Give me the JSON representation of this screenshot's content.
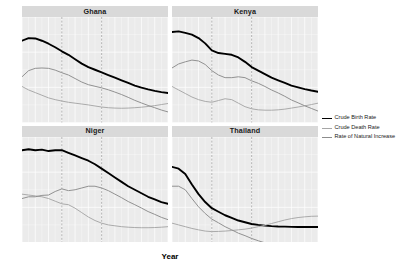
{
  "chart_data": {
    "type": "line",
    "title": "",
    "xlabel": "Year",
    "ylabel": "",
    "xlim": [
      1960,
      2070
    ],
    "ylim": [
      0,
      60
    ],
    "grid": true,
    "legend_position": "right",
    "facet_layout": "2x2",
    "xticks": [
      1960,
      1970,
      1980,
      1990,
      2000,
      2010,
      2020,
      2030,
      2040,
      2050,
      2060,
      2070
    ],
    "xtick_labels": [
      "1960",
      "1970",
      "1980",
      "1990",
      "2000",
      "2010",
      "2020",
      "2030",
      "2040",
      "2050",
      "2060",
      "2070"
    ],
    "yticks": [
      0,
      20,
      40,
      60
    ],
    "ytick_labels": [
      "0",
      "20",
      "40",
      "60"
    ],
    "reference_lines": [
      1990,
      2020
    ],
    "series_names": [
      "Crude Birth Rate",
      "Crude Death Rate",
      "Rate of Natural Increase"
    ],
    "series_colors": [
      "#000000",
      "#a6a6a6",
      "#8c8c8c"
    ],
    "x": [
      1960,
      1965,
      1970,
      1975,
      1980,
      1985,
      1990,
      1995,
      2000,
      2005,
      2010,
      2015,
      2020,
      2025,
      2030,
      2035,
      2040,
      2045,
      2050,
      2055,
      2060,
      2065,
      2070
    ],
    "panels": [
      {
        "name": "Ghana",
        "series": [
          {
            "name": "Crude Birth Rate",
            "values": [
              46.5,
              48.0,
              47.8,
              46.5,
              44.8,
              42.8,
              40.5,
              38.5,
              36.0,
              33.5,
              31.5,
              30.0,
              28.5,
              27.0,
              25.5,
              24.0,
              22.5,
              21.0,
              19.8,
              18.8,
              18.0,
              17.3,
              16.8
            ]
          },
          {
            "name": "Crude Death Rate",
            "values": [
              20.5,
              18.5,
              17.0,
              15.5,
              14.0,
              13.0,
              12.2,
              11.5,
              11.0,
              10.5,
              10.0,
              9.4,
              8.8,
              8.4,
              8.2,
              8.1,
              8.2,
              8.4,
              8.7,
              9.1,
              9.6,
              10.2,
              10.8
            ]
          },
          {
            "name": "Rate of Natural Increase",
            "values": [
              26.0,
              29.5,
              30.8,
              31.0,
              30.8,
              29.8,
              28.3,
              27.0,
              25.0,
              23.0,
              21.5,
              20.6,
              19.7,
              18.6,
              17.3,
              15.9,
              14.3,
              12.6,
              11.1,
              9.7,
              8.4,
              7.1,
              6.0
            ]
          }
        ]
      },
      {
        "name": "Kenya",
        "series": [
          {
            "name": "Crude Birth Rate",
            "values": [
              51.5,
              51.8,
              51.0,
              50.0,
              48.0,
              45.0,
              41.0,
              39.5,
              39.0,
              38.5,
              37.0,
              34.5,
              31.5,
              29.5,
              27.5,
              25.5,
              24.0,
              22.5,
              21.0,
              20.0,
              19.0,
              18.2,
              17.5
            ]
          },
          {
            "name": "Crude Death Rate",
            "values": [
              20.5,
              18.5,
              16.5,
              14.5,
              13.0,
              12.0,
              11.5,
              12.5,
              13.5,
              13.0,
              11.0,
              9.0,
              7.8,
              7.2,
              7.0,
              7.0,
              7.2,
              7.6,
              8.2,
              8.8,
              9.5,
              10.2,
              11.0
            ]
          },
          {
            "name": "Rate of Natural Increase",
            "values": [
              31.0,
              33.3,
              34.5,
              35.5,
              35.0,
              33.0,
              29.5,
              27.0,
              25.5,
              25.5,
              26.0,
              25.5,
              23.7,
              22.3,
              20.5,
              18.5,
              16.8,
              14.9,
              12.8,
              11.2,
              9.5,
              8.0,
              6.5
            ]
          }
        ]
      },
      {
        "name": "Niger",
        "series": [
          {
            "name": "Crude Birth Rate",
            "values": [
              52.5,
              53.0,
              52.5,
              52.8,
              52.0,
              52.5,
              52.5,
              51.0,
              49.5,
              48.0,
              46.5,
              44.5,
              42.0,
              39.5,
              37.0,
              34.5,
              32.0,
              30.0,
              28.0,
              26.0,
              24.5,
              23.0,
              22.0
            ]
          },
          {
            "name": "Crude Death Rate",
            "values": [
              27.5,
              27.0,
              26.5,
              26.0,
              25.0,
              23.5,
              22.0,
              21.5,
              19.5,
              17.0,
              14.5,
              12.5,
              11.0,
              10.0,
              9.5,
              9.0,
              8.7,
              8.5,
              8.4,
              8.4,
              8.5,
              8.7,
              9.0
            ]
          },
          {
            "name": "Rate of Natural Increase",
            "values": [
              25.0,
              26.0,
              26.0,
              26.8,
              27.0,
              29.0,
              30.5,
              29.5,
              30.0,
              31.0,
              32.0,
              32.0,
              31.0,
              29.5,
              27.5,
              25.5,
              23.3,
              21.5,
              19.6,
              17.6,
              16.0,
              14.3,
              13.0
            ]
          }
        ]
      },
      {
        "name": "Thailand",
        "series": [
          {
            "name": "Crude Birth Rate",
            "values": [
              43.0,
              42.0,
              39.0,
              33.0,
              27.5,
              23.0,
              19.5,
              17.5,
              15.5,
              14.0,
              12.5,
              11.5,
              10.5,
              10.0,
              9.6,
              9.3,
              9.1,
              9.0,
              8.9,
              8.8,
              8.8,
              8.8,
              8.8
            ]
          },
          {
            "name": "Crude Death Rate",
            "values": [
              11.0,
              10.0,
              9.0,
              8.0,
              7.2,
              6.5,
              6.2,
              6.3,
              6.5,
              6.8,
              7.2,
              7.6,
              8.2,
              9.0,
              9.8,
              10.8,
              11.8,
              12.8,
              13.6,
              14.2,
              14.6,
              14.9,
              15.0
            ]
          },
          {
            "name": "Rate of Natural Increase",
            "values": [
              32.0,
              32.0,
              30.0,
              25.0,
              20.3,
              16.5,
              13.3,
              11.2,
              9.0,
              7.2,
              5.3,
              3.9,
              2.3,
              1.0,
              -0.2,
              -1.5,
              -2.7,
              -3.8,
              -4.7,
              -5.4,
              -5.8,
              -6.1,
              -6.2
            ]
          }
        ]
      }
    ]
  },
  "legend": {
    "items": [
      {
        "label": "Crude Birth Rate"
      },
      {
        "label": "Crude Death Rate"
      },
      {
        "label": "Rate of Natural Increase"
      }
    ]
  },
  "axis": {
    "x_title": "Year"
  }
}
